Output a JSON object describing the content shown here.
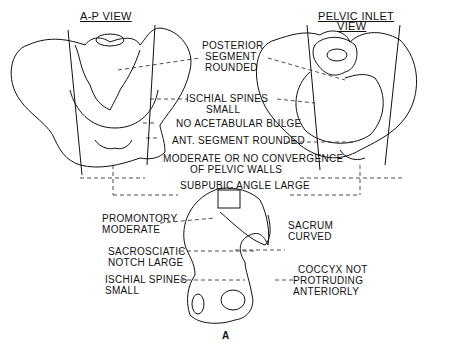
{
  "diagram": {
    "views": {
      "ap_view_title": "A-P VIEW",
      "inlet_view_title_1": "PELVIC INLET",
      "inlet_view_title_2": "VIEW"
    },
    "center_labels": {
      "posterior_1": "POSTERIOR",
      "posterior_2": "SEGMENT",
      "posterior_3": "ROUNDED",
      "ischial_1": "ISCHIAL SPINES",
      "ischial_2": "SMALL",
      "acetabular": "NO ACETABULAR BULGE",
      "ant_segment": "ANT. SEGMENT ROUNDED",
      "convergence_1": "MODERATE OR NO CONVERGENCE",
      "convergence_2": "OF PELVIC WALLS",
      "subpubic": "SUBPUBIC ANGLE LARGE"
    },
    "lateral_labels": {
      "promontory_1": "PROMONTORY",
      "promontory_2": "MODERATE",
      "sacrum_1": "SACRUM",
      "sacrum_2": "CURVED",
      "notch_1": "SACROSCIATIC",
      "notch_2": "NOTCH LARGE",
      "spines_1": "ISCHIAL SPINES",
      "spines_2": "SMALL",
      "coccyx_1": "COCCYX NOT",
      "coccyx_2": "PROTRUDING",
      "coccyx_3": "ANTERIORLY"
    },
    "figure_letter": "A"
  }
}
